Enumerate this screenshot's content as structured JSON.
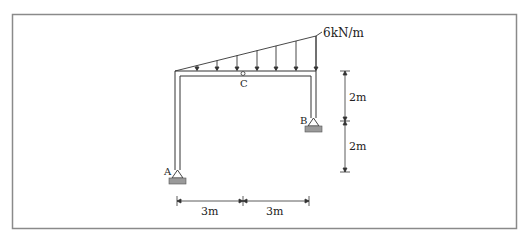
{
  "diagram": {
    "type": "structural-frame",
    "load": {
      "type": "triangular-distributed",
      "max_label": "6kN/m",
      "arrow_count": 8
    },
    "nodes": {
      "A": "A",
      "B": "B",
      "C": "C"
    },
    "dimensions": {
      "horizontal": [
        "3m",
        "3m"
      ],
      "vertical": [
        "2m",
        "2m"
      ]
    },
    "colors": {
      "line": "#333333",
      "border": "#8a8a8a",
      "ground_hatch": "#9a9a9a"
    }
  }
}
